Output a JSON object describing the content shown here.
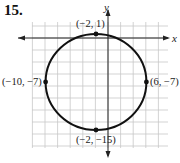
{
  "problem": {
    "number": "15."
  },
  "graph": {
    "x_axis_label": "x",
    "y_axis_label": "y",
    "grid_step_units": 2,
    "x_range": [
      -12,
      8
    ],
    "y_range": [
      -17,
      3
    ],
    "circle": {
      "center": [
        -2,
        -7
      ],
      "radius": 8
    },
    "points": [
      {
        "x": -2,
        "y": 1,
        "label": "(−2, 1)"
      },
      {
        "x": -10,
        "y": -7,
        "label": "(−10, −7)"
      },
      {
        "x": 6,
        "y": -7,
        "label": "(6, −7)"
      },
      {
        "x": -2,
        "y": -15,
        "label": "(−2, −15)"
      }
    ],
    "colors": {
      "grid": "#c8c8c8",
      "curve": "#111111",
      "axis": "#222222"
    }
  }
}
